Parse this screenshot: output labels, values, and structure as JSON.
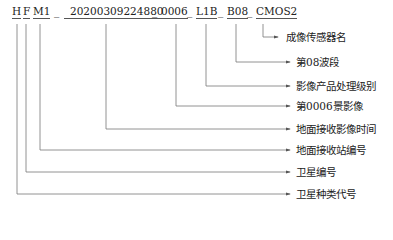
{
  "filename_segments": [
    {
      "id": "satellite_type",
      "text": "H"
    },
    {
      "id": "satellite_no",
      "text": "F"
    },
    {
      "id": "station_code",
      "text": "M1"
    },
    {
      "id": "receive_time",
      "text": "20200309224880"
    },
    {
      "id": "scene_no",
      "text": "0006"
    },
    {
      "id": "product_level",
      "text": "L1B"
    },
    {
      "id": "band",
      "text": "B08"
    },
    {
      "id": "sensor",
      "text": "CMOS2"
    }
  ],
  "separator": "_",
  "labels": [
    {
      "id": "sensor",
      "text": "成像传感器名"
    },
    {
      "id": "band",
      "text": "第08波段"
    },
    {
      "id": "product_level",
      "text": "影像产品处理级别"
    },
    {
      "id": "scene_no",
      "text": "第0006景影像"
    },
    {
      "id": "receive_time",
      "text": "地面接收影像时间"
    },
    {
      "id": "station_code",
      "text": "地面接收站编号"
    },
    {
      "id": "satellite_no",
      "text": "卫星编号"
    },
    {
      "id": "satellite_type",
      "text": "卫星种类代号"
    }
  ],
  "colors": {
    "line": "#777777",
    "text": "#222222"
  }
}
